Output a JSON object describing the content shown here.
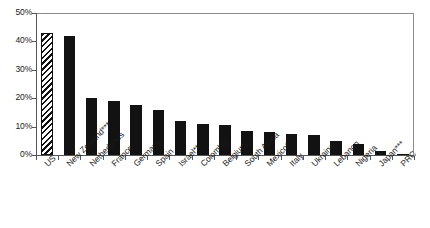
{
  "chart_data": {
    "type": "bar",
    "title": "",
    "subtitle": "",
    "xlabel": "",
    "ylabel": "",
    "ylim": [
      0,
      50
    ],
    "ytick_labels": [
      "50%",
      "40%",
      "30%",
      "20%",
      "10%",
      "0%"
    ],
    "ytick_values": [
      50,
      40,
      30,
      20,
      10,
      0
    ],
    "grid": false,
    "legend": "none",
    "categories": [
      "US",
      "New Zealand***",
      "Netherlands",
      "France",
      "Germany",
      "Spain",
      "Israel**",
      "Colombia*",
      "Belgium",
      "South Africa",
      "Mexico*",
      "Italy",
      "Ukraine",
      "Lebanon",
      "Nigeria",
      "Japan***",
      "PRC"
    ],
    "values": [
      43,
      42,
      20,
      19,
      17.5,
      16,
      12,
      11,
      10.5,
      8.5,
      8,
      7.5,
      7,
      5,
      4,
      1.5,
      0.3
    ],
    "bar_styles": [
      "hatched",
      "solid",
      "solid",
      "solid",
      "solid",
      "solid",
      "solid",
      "solid",
      "solid",
      "solid",
      "solid",
      "solid",
      "solid",
      "solid",
      "solid",
      "solid",
      "solid"
    ]
  },
  "colors": {
    "bar_fill": "#121212",
    "axis": "#555555",
    "frame": "#8c8c8c",
    "background": "#ffffff",
    "text": "#1a1a1a"
  }
}
